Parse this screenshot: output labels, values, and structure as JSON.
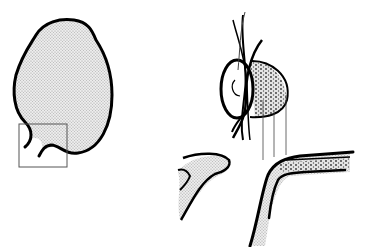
{
  "figure": {
    "width": 365,
    "height": 247,
    "background": "#ffffff",
    "stroke_color": "#000000",
    "fill_color": "#d9d9d9",
    "panels": [
      {
        "id": "left",
        "description": "blob outline with stippled fill and inset rectangle at lower-left"
      },
      {
        "id": "upper-right",
        "description": "cross-section of tube with crossing strands and stippled end"
      },
      {
        "id": "lower-right",
        "description": "enlarged detail: curved shaded shape and bent layered wall"
      }
    ]
  }
}
